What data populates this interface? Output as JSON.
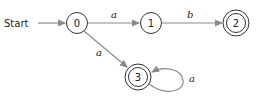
{
  "diagram": {
    "type": "finite-automaton",
    "start_label": "Start",
    "colors": {
      "edge": "#8a8a8a",
      "node_stroke": "#333333",
      "text": "#222222"
    },
    "states": [
      {
        "id": "0",
        "label": "0",
        "accepting": false,
        "start": true
      },
      {
        "id": "1",
        "label": "1",
        "accepting": false
      },
      {
        "id": "2",
        "label": "2",
        "accepting": true
      },
      {
        "id": "3",
        "label": "3",
        "accepting": true
      }
    ],
    "transitions": [
      {
        "from": "0",
        "to": "1",
        "label": "a"
      },
      {
        "from": "1",
        "to": "2",
        "label": "b"
      },
      {
        "from": "0",
        "to": "3",
        "label": "a"
      },
      {
        "from": "3",
        "to": "3",
        "label": "a"
      }
    ]
  }
}
